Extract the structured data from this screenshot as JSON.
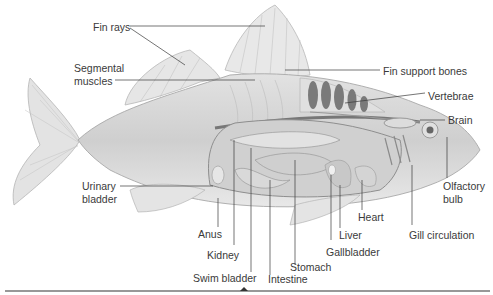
{
  "diagram": {
    "colors": {
      "body": "#d6d6d6",
      "fin": "#e4e4e4",
      "organ": "#c4c4c4",
      "dark_organ": "#7a7a7a",
      "leader_line": "#3a3a3a",
      "text": "#3a3a3a"
    },
    "labels": {
      "fin_rays": "Fin rays",
      "segmental_muscles_1": "Segmental",
      "segmental_muscles_2": "muscles",
      "fin_support_bones": "Fin support bones",
      "vertebrae": "Vertebrae",
      "brain": "Brain",
      "urinary_bladder_1": "Urinary",
      "urinary_bladder_2": "bladder",
      "olfactory_bulb_1": "Olfactory",
      "olfactory_bulb_2": "bulb",
      "anus": "Anus",
      "heart": "Heart",
      "liver": "Liver",
      "gill_circulation": "Gill circulation",
      "kidney": "Kidney",
      "gallbladder": "Gallbladder",
      "stomach": "Stomach",
      "swim_bladder": "Swim bladder",
      "intestine": "Intestine"
    }
  }
}
